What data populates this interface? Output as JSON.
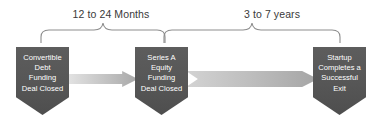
{
  "diagram": {
    "colors": {
      "node_fill": "#565656",
      "node_text": "#ffffff",
      "brace_stroke": "#8d8d8d",
      "arrow_light": "#e4e4e4",
      "arrow_dark": "#a5a5a5",
      "label_text": "#3a3a3a",
      "background": "#ffffff"
    },
    "spans": [
      {
        "id": "span-1",
        "label": "12 to 24 Months",
        "from": "node-1",
        "to": "node-2"
      },
      {
        "id": "span-2",
        "label": "3 to 7 years",
        "from": "node-2",
        "to": "node-3"
      }
    ],
    "nodes": [
      {
        "id": "node-1",
        "label": "Convertible\nDebt\nFunding\nDeal Closed",
        "lines": [
          "Convertible",
          "Debt",
          "Funding",
          "Deal Closed"
        ]
      },
      {
        "id": "node-2",
        "label": "Series A\nEquity\nFunding\nDeal Closed",
        "lines": [
          "Series A",
          "Equity",
          "Funding",
          "Deal Closed"
        ]
      },
      {
        "id": "node-3",
        "label": "Startup\nCompletes a\nSuccessful\nExit",
        "lines": [
          "Startup",
          "Completes a",
          "Successful",
          "Exit"
        ]
      }
    ],
    "connectors": [
      {
        "id": "connector-1",
        "shape": "right-arrow-icon",
        "from": "node-1",
        "to": "node-2"
      },
      {
        "id": "connector-2",
        "shape": "chevron-arrow-icon",
        "from": "node-2",
        "to": "node-3"
      }
    ]
  }
}
